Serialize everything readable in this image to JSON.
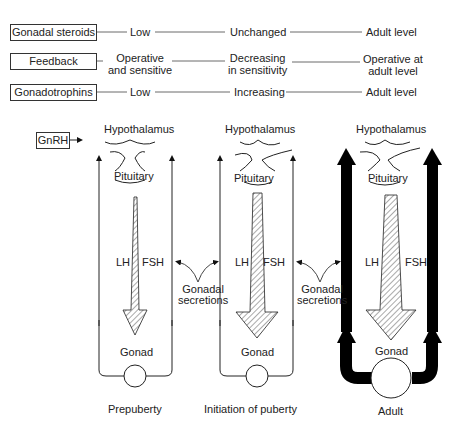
{
  "table": {
    "rows": [
      {
        "label": "Gonadal steroids",
        "prepuberty": "Low",
        "initiation": "Unchanged",
        "adult": "Adult level"
      },
      {
        "label": "Feedback",
        "prepuberty": "Operative\nand sensitive",
        "initiation": "Decreasing\nin sensitivity",
        "adult": "Operative at\nadult level"
      },
      {
        "label": "Gonadotrophins",
        "prepuberty": "Low",
        "initiation": "Increasing",
        "adult": "Adult level"
      }
    ]
  },
  "diagram": {
    "gnrh_label": "GnRH",
    "panels": [
      {
        "hypothalamus": "Hypothalamus",
        "pituitary": "Pituitary",
        "lh": "LH",
        "fsh": "FSH",
        "gonad": "Gonad",
        "stage": "Prepuberty"
      },
      {
        "hypothalamus": "Hypothalamus",
        "pituitary": "Pituitary",
        "lh": "LH",
        "fsh": "FSH",
        "gonad": "Gonad",
        "stage": "Initiation of puberty"
      },
      {
        "hypothalamus": "Hypothalamus",
        "pituitary": "Pituitary",
        "lh": "LH",
        "fsh": "FSH",
        "gonad": "Gonad",
        "stage": "Adult"
      }
    ],
    "secretions": [
      {
        "line1": "Gonadal",
        "line2": "secretions"
      },
      {
        "line1": "Gonadal",
        "line2": "secretions"
      }
    ]
  }
}
